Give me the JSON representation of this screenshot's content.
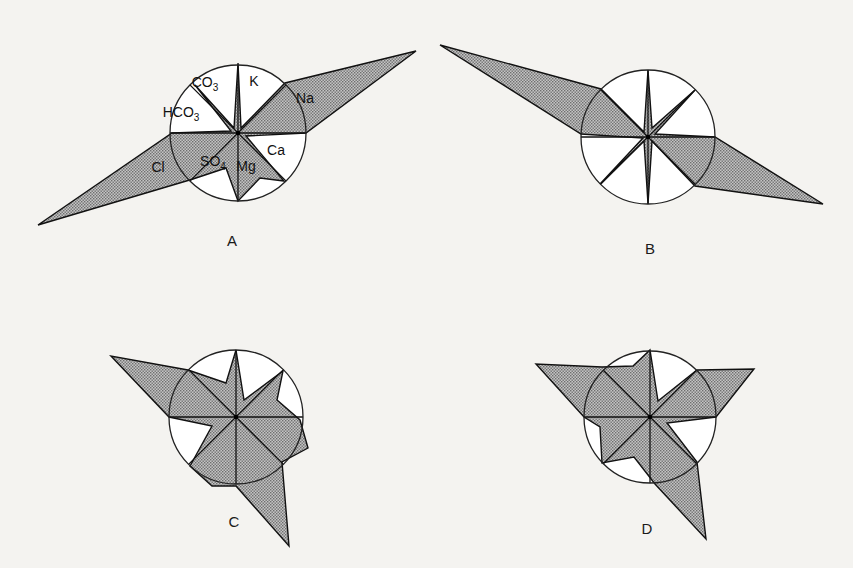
{
  "figure": {
    "background": "#f4f3f0",
    "fill_color": "#9a9a9a",
    "line_color": "#111111",
    "circle_color": "#222222"
  },
  "panels": [
    {
      "id": "A",
      "label": "A",
      "center": [
        238,
        133
      ],
      "radius": 68,
      "label_pos": [
        232,
        246
      ],
      "ions": [
        {
          "name": "K",
          "text": "K",
          "sub": "",
          "pos": [
            254,
            86
          ]
        },
        {
          "name": "Na",
          "text": "Na",
          "sub": "",
          "pos": [
            305,
            103
          ]
        },
        {
          "name": "Ca",
          "text": "Ca",
          "sub": "",
          "pos": [
            276,
            155
          ]
        },
        {
          "name": "Mg",
          "text": "Mg",
          "sub": "",
          "pos": [
            246,
            171
          ]
        },
        {
          "name": "SO4",
          "text": "SO",
          "sub": "4",
          "pos": [
            213,
            166
          ]
        },
        {
          "name": "Cl",
          "text": "Cl",
          "sub": "",
          "pos": [
            158,
            172
          ]
        },
        {
          "name": "HCO3",
          "text": "HCO",
          "sub": "3",
          "pos": [
            181,
            117
          ]
        },
        {
          "name": "CO3",
          "text": "CO",
          "sub": "3",
          "pos": [
            205,
            87
          ]
        }
      ],
      "polygon": [
        [
          238,
          63
        ],
        [
          241,
          128
        ],
        [
          285,
          83
        ],
        [
          416,
          51
        ],
        [
          306,
          133
        ],
        [
          246,
          136
        ],
        [
          284,
          181
        ],
        [
          260,
          178
        ],
        [
          238,
          201
        ],
        [
          226,
          168
        ],
        [
          193,
          179
        ],
        [
          38,
          225
        ],
        [
          172,
          133
        ],
        [
          231,
          131
        ],
        [
          195,
          85
        ],
        [
          234,
          128
        ]
      ]
    },
    {
      "id": "B",
      "label": "B",
      "center": [
        648,
        137
      ],
      "radius": 67,
      "label_pos": [
        650,
        254
      ],
      "ions": [],
      "polygon": [
        [
          648,
          70
        ],
        [
          652,
          128
        ],
        [
          695,
          90
        ],
        [
          655,
          134
        ],
        [
          715,
          137
        ],
        [
          823,
          204
        ],
        [
          695,
          186
        ],
        [
          652,
          141
        ],
        [
          648,
          204
        ],
        [
          644,
          141
        ],
        [
          600,
          184
        ],
        [
          643,
          138
        ],
        [
          581,
          134
        ],
        [
          440,
          45
        ],
        [
          601,
          89
        ],
        [
          644,
          132
        ]
      ]
    },
    {
      "id": "C",
      "label": "C",
      "center": [
        236,
        417
      ],
      "radius": 67,
      "label_pos": [
        234,
        527
      ],
      "ions": [],
      "polygon": [
        [
          236,
          350
        ],
        [
          244,
          400
        ],
        [
          283,
          371
        ],
        [
          277,
          400
        ],
        [
          300,
          420
        ],
        [
          308,
          448
        ],
        [
          282,
          462
        ],
        [
          289,
          546
        ],
        [
          236,
          486
        ],
        [
          212,
          486
        ],
        [
          190,
          466
        ],
        [
          212,
          426
        ],
        [
          169,
          417
        ],
        [
          111,
          356
        ],
        [
          188,
          370
        ],
        [
          226,
          383
        ]
      ]
    },
    {
      "id": "D",
      "label": "D",
      "center": [
        650,
        417
      ],
      "radius": 66,
      "label_pos": [
        647,
        534
      ],
      "ions": [],
      "polygon": [
        [
          650,
          350
        ],
        [
          658,
          401
        ],
        [
          697,
          370
        ],
        [
          754,
          369
        ],
        [
          716,
          417
        ],
        [
          667,
          423
        ],
        [
          697,
          462
        ],
        [
          706,
          539
        ],
        [
          655,
          484
        ],
        [
          634,
          457
        ],
        [
          602,
          463
        ],
        [
          600,
          427
        ],
        [
          584,
          417
        ],
        [
          536,
          364
        ],
        [
          602,
          367
        ],
        [
          633,
          366
        ]
      ]
    }
  ]
}
